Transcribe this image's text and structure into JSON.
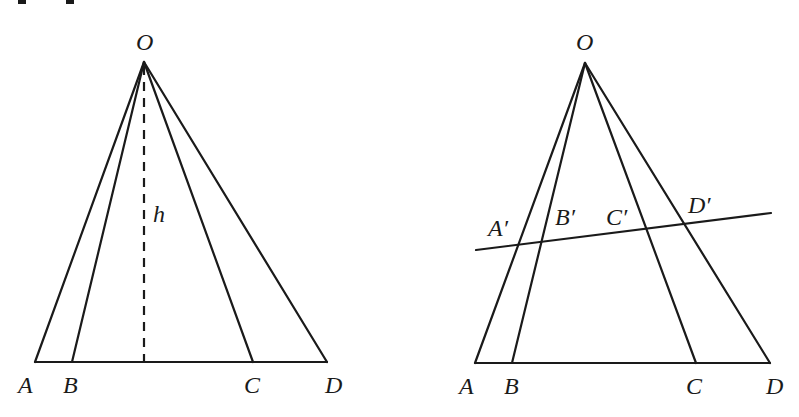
{
  "header_fragment": "proper...",
  "left_figure": {
    "apex": {
      "label": "O",
      "x": 144,
      "y": 62
    },
    "base_y": 362,
    "base_points": [
      {
        "label": "A",
        "x": 35
      },
      {
        "label": "B",
        "x": 72
      },
      {
        "label": "C",
        "x": 253
      },
      {
        "label": "D",
        "x": 327
      }
    ],
    "height_label": "h",
    "height_foot_x": 144
  },
  "right_figure": {
    "apex": {
      "label": "O",
      "x": 585,
      "y": 63
    },
    "base_y": 363,
    "base_points": [
      {
        "label": "A",
        "x": 475
      },
      {
        "label": "B",
        "x": 512
      },
      {
        "label": "C",
        "x": 696
      },
      {
        "label": "D",
        "x": 770
      }
    ],
    "transversal": {
      "x1": 476,
      "y1": 250,
      "x2": 771,
      "y2": 213
    },
    "transversal_points": [
      {
        "label": "A′"
      },
      {
        "label": "B′"
      },
      {
        "label": "C′"
      },
      {
        "label": "D′"
      }
    ]
  }
}
